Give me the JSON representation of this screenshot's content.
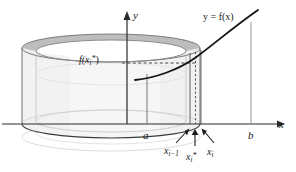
{
  "figure": {
    "kind": "shell-method-cylindrical-shell-diagram",
    "axes": {
      "y_axis_label": "y",
      "x_axis_label": "x",
      "origin_x": 127,
      "x_axis_y": 124
    },
    "labels": {
      "curve": "y = f(x)",
      "height_value": "f(x",
      "height_value_sub": "i",
      "height_value_sup": "*",
      "height_value_close": ")",
      "left_endpoint": "a",
      "right_endpoint": "b",
      "partition_left": "x",
      "partition_left_sub": "i−1",
      "sample_point": "x",
      "sample_point_sub": "i",
      "sample_point_sup": "*",
      "partition_right": "x",
      "partition_right_sub": "i"
    },
    "colors": {
      "ink": "#1b1b1b",
      "axis": "#2a2a2a",
      "curve": "#111111",
      "shell_rim": "#b8b8b8",
      "shell_rim_light": "#d6d6d6",
      "shell_body": "#f4f4f4",
      "shell_body_edge": "#9a9a9a",
      "faint_guide": "#cfcfcf",
      "dashed": "#3a3a3a",
      "background": "#ffffff"
    },
    "geometry": {
      "cylinder_left_x": 22,
      "cylinder_right_x": 200,
      "cylinder_center_x": 111,
      "top_ellipse_cy": 48,
      "bottom_ellipse_cy": 124,
      "ellipse_rx": 89,
      "ellipse_ry": 14,
      "inner_rx": 75,
      "inner_ry": 11,
      "x_im1": 190,
      "x_i_star": 195,
      "x_i": 201,
      "a_x": 147,
      "b_x": 251,
      "dashed_height_y": 63
    }
  }
}
